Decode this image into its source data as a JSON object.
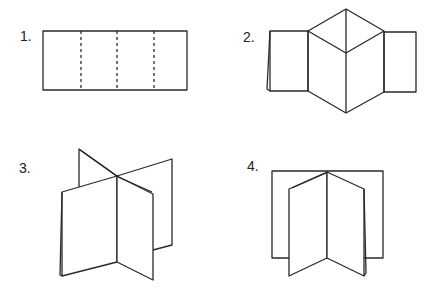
{
  "steps": [
    {
      "label": "1.",
      "description": "Flat strip with three dashed fold lines"
    },
    {
      "label": "2.",
      "description": "Strip folded with center diamond"
    },
    {
      "label": "3.",
      "description": "Folded booklet with cross-shaped sheets"
    },
    {
      "label": "4.",
      "description": "Folded booklet standing on back sheet"
    }
  ],
  "colors": {
    "line": "#2a2a2a",
    "background": "#ffffff"
  }
}
